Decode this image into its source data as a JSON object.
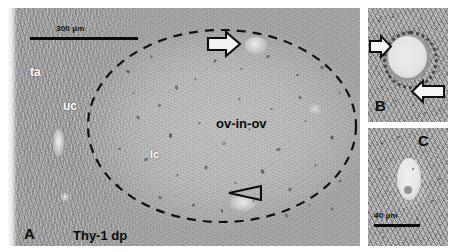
{
  "figure": {
    "kind": "histology-micrograph-multipanel",
    "panels": [
      {
        "id": "A",
        "label": "A",
        "scale_bar": {
          "label": "300 µm",
          "length_px": 108
        },
        "annotations": [
          {
            "name": "tunica-albuginea",
            "label": "ta",
            "style": "white"
          },
          {
            "name": "upper-cortex",
            "label": "uc",
            "style": "white"
          },
          {
            "name": "lower-cortex",
            "label": "lc",
            "style": "white"
          },
          {
            "name": "ovary-in-ovary",
            "label": "ov-in-ov",
            "style": "black"
          },
          {
            "name": "thy1-dense-plate",
            "label": "Thy-1 dp",
            "style": "black"
          }
        ],
        "markers": [
          {
            "name": "block-arrow-follicle",
            "shape": "block-arrow",
            "direction": "right"
          },
          {
            "name": "open-arrowhead-follicle",
            "shape": "open-arrowhead",
            "direction": "left"
          }
        ],
        "outline": {
          "name": "dashed-ellipse-boundary",
          "style": "dashed"
        }
      },
      {
        "id": "B",
        "label": "B",
        "markers": [
          {
            "name": "block-arrow-upper-left",
            "shape": "block-arrow",
            "direction": "right"
          },
          {
            "name": "block-arrow-lower-right",
            "shape": "block-arrow",
            "direction": "left"
          }
        ]
      },
      {
        "id": "C",
        "label": "C",
        "scale_bar": {
          "label": "40 µm",
          "length_px": 46
        }
      }
    ]
  },
  "colors": {
    "background": "#ffffff",
    "tissue_light": "#c2c2c2",
    "tissue_dark": "#7e7e7e",
    "ink": "#0b0b0b",
    "label_white": "#ffffff"
  },
  "speckles_a": [
    [
      118,
      62,
      4,
      3
    ],
    [
      142,
      48,
      3,
      2
    ],
    [
      166,
      78,
      5,
      3
    ],
    [
      150,
      96,
      3,
      3
    ],
    [
      186,
      70,
      3,
      2
    ],
    [
      205,
      52,
      4,
      2
    ],
    [
      232,
      60,
      3,
      2
    ],
    [
      258,
      47,
      4,
      3
    ],
    [
      288,
      66,
      3,
      2
    ],
    [
      312,
      58,
      4,
      3
    ],
    [
      330,
      84,
      3,
      2
    ],
    [
      128,
      108,
      4,
      3
    ],
    [
      160,
      126,
      5,
      3
    ],
    [
      190,
      114,
      3,
      2
    ],
    [
      214,
      134,
      4,
      3
    ],
    [
      240,
      120,
      3,
      2
    ],
    [
      268,
      140,
      5,
      3
    ],
    [
      296,
      112,
      3,
      2
    ],
    [
      322,
      128,
      4,
      3
    ],
    [
      136,
      150,
      4,
      3
    ],
    [
      168,
      166,
      3,
      2
    ],
    [
      196,
      158,
      4,
      3
    ],
    [
      226,
      174,
      3,
      2
    ],
    [
      252,
      162,
      5,
      3
    ],
    [
      280,
      180,
      4,
      3
    ],
    [
      306,
      156,
      3,
      2
    ],
    [
      330,
      172,
      4,
      2
    ],
    [
      150,
      188,
      4,
      3
    ],
    [
      184,
      196,
      3,
      2
    ],
    [
      212,
      202,
      4,
      2
    ],
    [
      244,
      192,
      3,
      2
    ],
    [
      276,
      206,
      5,
      3
    ],
    [
      300,
      196,
      3,
      2
    ],
    [
      322,
      200,
      4,
      2
    ],
    [
      124,
      84,
      3,
      2
    ],
    [
      110,
      140,
      3,
      2
    ],
    [
      108,
      176,
      4,
      2
    ],
    [
      290,
      88,
      4,
      3
    ],
    [
      262,
      100,
      3,
      2
    ],
    [
      230,
      90,
      3,
      2
    ]
  ],
  "speckles_b": [
    [
      10,
      12,
      3,
      2
    ],
    [
      24,
      8,
      2,
      2
    ],
    [
      52,
      10,
      3,
      2
    ],
    [
      66,
      20,
      2,
      2
    ],
    [
      14,
      34,
      3,
      2
    ],
    [
      8,
      58,
      2,
      2
    ],
    [
      12,
      78,
      3,
      2
    ],
    [
      26,
      92,
      3,
      2
    ],
    [
      44,
      96,
      2,
      2
    ],
    [
      62,
      84,
      3,
      2
    ],
    [
      70,
      62,
      2,
      2
    ],
    [
      68,
      40,
      3,
      2
    ],
    [
      34,
      24,
      2,
      2
    ],
    [
      6,
      100,
      3,
      2
    ],
    [
      56,
      104,
      2,
      2
    ],
    [
      72,
      100,
      3,
      2
    ],
    [
      20,
      66,
      2,
      2
    ]
  ],
  "speckles_c": [
    [
      12,
      14,
      3,
      2
    ],
    [
      30,
      8,
      2,
      2
    ],
    [
      54,
      16,
      3,
      2
    ],
    [
      68,
      28,
      2,
      2
    ],
    [
      10,
      40,
      3,
      2
    ],
    [
      18,
      62,
      2,
      2
    ],
    [
      8,
      86,
      3,
      2
    ],
    [
      28,
      98,
      2,
      2
    ],
    [
      48,
      90,
      3,
      2
    ],
    [
      64,
      72,
      2,
      2
    ],
    [
      70,
      50,
      3,
      2
    ],
    [
      60,
      104,
      2,
      2
    ],
    [
      36,
      110,
      3,
      2
    ],
    [
      14,
      108,
      2,
      2
    ],
    [
      70,
      96,
      3,
      2
    ],
    [
      44,
      40,
      2,
      2
    ]
  ]
}
